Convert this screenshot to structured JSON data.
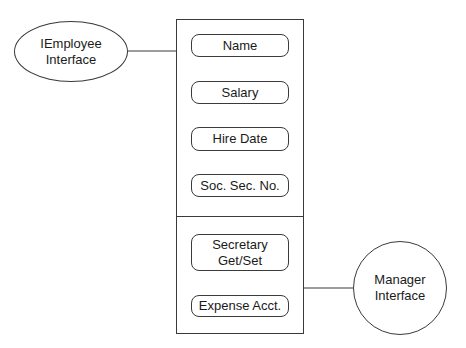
{
  "diagram": {
    "title": "",
    "interfaces": [
      {
        "id": "iemployee",
        "label_line1": "IEmployee",
        "label_line2": "Interface",
        "shape": "ellipse"
      },
      {
        "id": "manager",
        "label_line1": "Manager",
        "label_line2": "Interface",
        "shape": "circle"
      }
    ],
    "object": {
      "sections": [
        {
          "interface": "iemployee",
          "members": [
            {
              "label": "Name"
            },
            {
              "label": "Salary"
            },
            {
              "label": "Hire Date"
            },
            {
              "label": "Soc. Sec. No."
            }
          ]
        },
        {
          "interface": "manager",
          "members": [
            {
              "label_line1": "Secretary",
              "label_line2": "Get/Set"
            },
            {
              "label": "Expense Acct."
            }
          ]
        }
      ]
    },
    "connections": [
      {
        "from": "iemployee",
        "to": "object-section-0"
      },
      {
        "from": "manager",
        "to": "object-section-1"
      }
    ],
    "colors": {
      "stroke": "#3a3a3a",
      "background": "#ffffff",
      "text": "#1a1a1a"
    }
  }
}
